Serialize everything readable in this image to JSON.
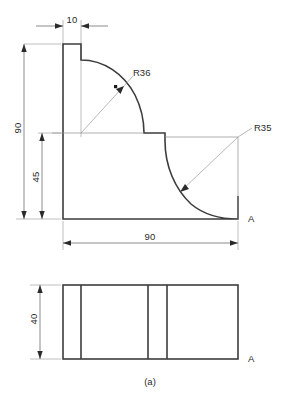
{
  "drawing": {
    "caption": "(a)",
    "views": {
      "front": {
        "name": "front-elevation-view",
        "section_label": "A",
        "dimensions": [
          {
            "id": "width-10",
            "value": "10",
            "orientation": "horizontal"
          },
          {
            "id": "height-90",
            "value": "90",
            "orientation": "vertical"
          },
          {
            "id": "height-45",
            "value": "45",
            "orientation": "vertical"
          },
          {
            "id": "width-90",
            "value": "90",
            "orientation": "horizontal"
          }
        ],
        "radii": [
          {
            "id": "radius-upper",
            "value": "R36"
          },
          {
            "id": "radius-lower",
            "value": "R35"
          }
        ]
      },
      "top": {
        "name": "top-plan-view",
        "section_label": "A",
        "dimensions": [
          {
            "id": "depth-40",
            "value": "40",
            "orientation": "vertical"
          }
        ]
      }
    },
    "colors": {
      "outline": "#3c3c3c",
      "dimension": "#5a5a5a",
      "extension": "#9a9a9a",
      "text": "#2b2b2b",
      "background": "#ffffff"
    }
  }
}
